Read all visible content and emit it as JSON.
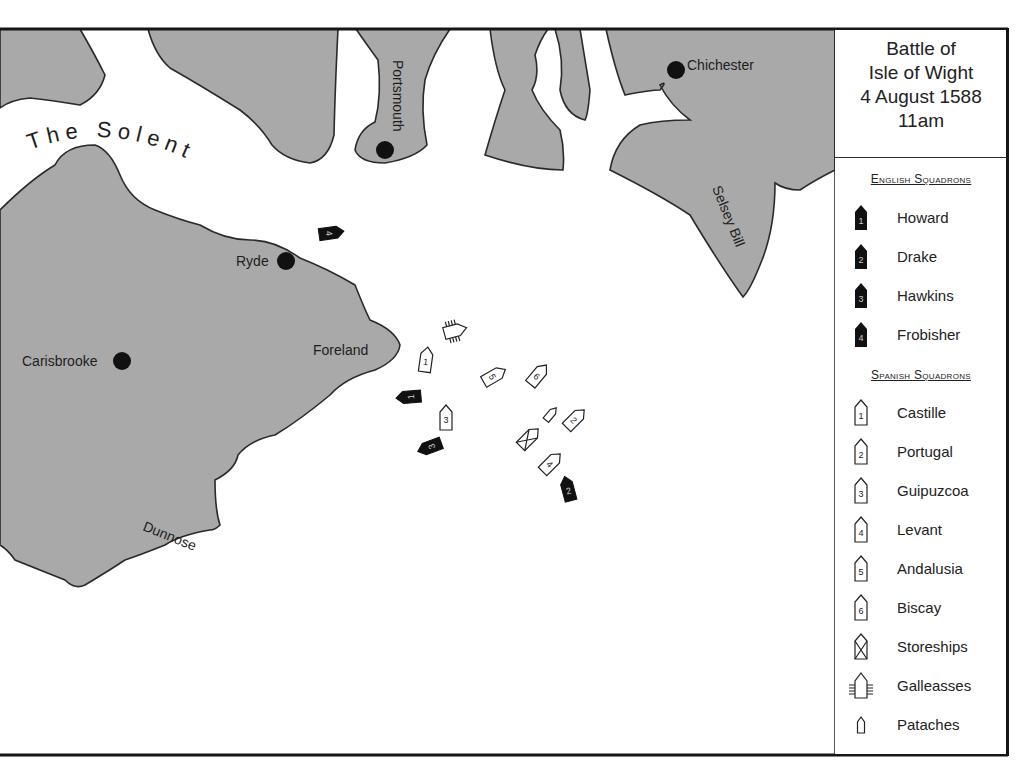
{
  "title": {
    "lines": [
      "Battle of",
      "Isle of Wight",
      "4 August 1588",
      "11am"
    ]
  },
  "legend": {
    "english_heading": "English Squadrons",
    "english": [
      {
        "num": "1",
        "label": "Howard"
      },
      {
        "num": "2",
        "label": "Drake"
      },
      {
        "num": "3",
        "label": "Hawkins"
      },
      {
        "num": "4",
        "label": "Frobisher"
      }
    ],
    "spanish_heading": "Spanish Squadrons",
    "spanish": [
      {
        "num": "1",
        "label": "Castille"
      },
      {
        "num": "2",
        "label": "Portugal"
      },
      {
        "num": "3",
        "label": "Guipuzcoa"
      },
      {
        "num": "4",
        "label": "Levant"
      },
      {
        "num": "5",
        "label": "Andalusia"
      },
      {
        "num": "6",
        "label": "Biscay"
      }
    ],
    "other": [
      {
        "icon": "storeship-icon",
        "label": "Storeships"
      },
      {
        "icon": "galleass-icon",
        "label": "Galleasses"
      },
      {
        "icon": "patache-icon",
        "label": "Pataches"
      }
    ]
  },
  "map": {
    "water_label": "The Solent",
    "places": {
      "portsmouth": "Portsmouth",
      "chichester": "Chichester",
      "selsey_bill": "Selsey Bill",
      "ryde": "Ryde",
      "carisbrooke": "Carisbrooke",
      "foreland": "Foreland",
      "dunnose": "Dunnose"
    },
    "colors": {
      "land": "#a9a9a9",
      "sea": "#ffffff",
      "english_ship": "#111111",
      "spanish_ship": "#ffffff"
    }
  }
}
